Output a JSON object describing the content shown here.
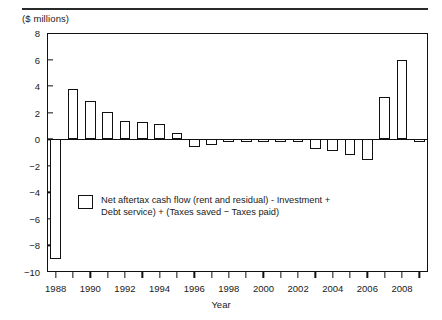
{
  "figure": {
    "unit_label": "($ millions)",
    "axis_title_x": "Year"
  },
  "legend": {
    "label": "Net aftertax cash flow (rent and residual) - Investment +\nDebt service) +  (Taxes saved  −  Taxes paid)"
  },
  "chart_data": {
    "type": "bar",
    "title": "",
    "subtitle": "",
    "xlabel": "Year",
    "ylabel": "($ millions)",
    "ylim": [
      -10,
      8
    ],
    "xlim": [
      1987.5,
      2009.5
    ],
    "yticks": [
      8,
      6,
      4,
      2,
      0,
      -2,
      -4,
      -6,
      -8,
      -10
    ],
    "ytick_labels": [
      "8",
      "6",
      "4",
      "2",
      "0",
      "−2",
      "−4",
      "−6",
      "−8",
      "−10"
    ],
    "xticks": [
      1988,
      1989,
      1990,
      1991,
      1992,
      1993,
      1994,
      1995,
      1996,
      1997,
      1998,
      1999,
      2000,
      2001,
      2002,
      2003,
      2004,
      2005,
      2006,
      2007,
      2008,
      2009
    ],
    "xtick_labels_shown": [
      "1988",
      "1990",
      "1992",
      "1994",
      "1996",
      "1998",
      "2000",
      "2002",
      "2004",
      "2006",
      "2008"
    ],
    "grid": false,
    "legend_position": "inside-lower-left",
    "bar_color": "#ffffff",
    "bar_edge_color": "#111111",
    "categories": [
      1988,
      1989,
      1990,
      1991,
      1992,
      1993,
      1994,
      1995,
      1996,
      1997,
      1998,
      1999,
      2000,
      2001,
      2002,
      2003,
      2004,
      2005,
      2006,
      2007,
      2008,
      2009
    ],
    "values": [
      -9.0,
      3.8,
      2.85,
      2.05,
      1.4,
      1.3,
      1.15,
      0.5,
      -0.55,
      -0.4,
      -0.05,
      -0.05,
      -0.05,
      -0.05,
      -0.05,
      -0.75,
      -0.85,
      -1.2,
      -1.6,
      3.2,
      6.0,
      -0.1
    ],
    "series": [
      {
        "name": "Net aftertax cash flow (rent and residual) - Investment + Debt service) +  (Taxes saved  −  Taxes paid)",
        "values": [
          -9.0,
          3.8,
          2.85,
          2.05,
          1.4,
          1.3,
          1.15,
          0.5,
          -0.55,
          -0.4,
          -0.05,
          -0.05,
          -0.05,
          -0.05,
          -0.05,
          -0.75,
          -0.85,
          -1.2,
          -1.6,
          3.2,
          6.0,
          -0.1
        ]
      }
    ]
  }
}
